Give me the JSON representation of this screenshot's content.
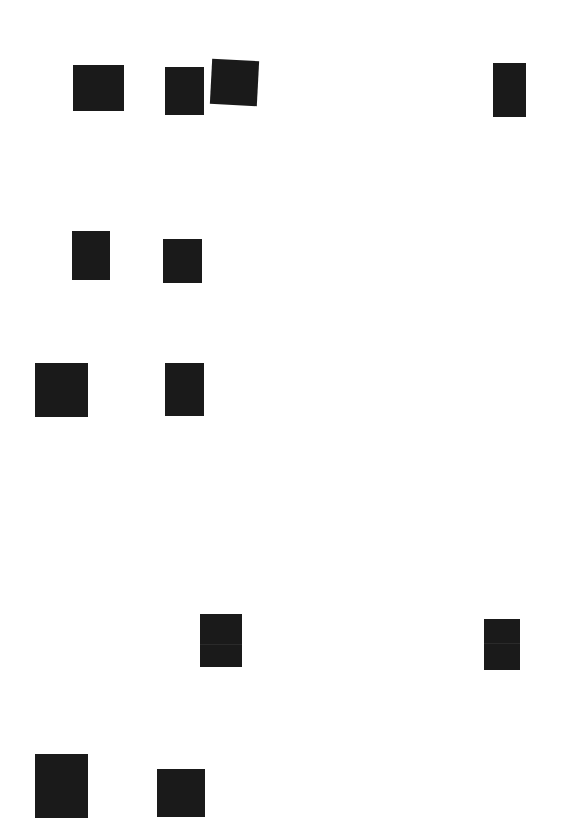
{
  "document": {
    "type": "redacted scanned page",
    "background_color": "#ffffff",
    "redaction_color": "#1a1a1a",
    "visible_text": []
  },
  "redactions": [
    {
      "id": 1,
      "x": 73,
      "y": 65,
      "w": 51,
      "h": 46,
      "rotate": 0
    },
    {
      "id": 2,
      "x": 165,
      "y": 67,
      "w": 39,
      "h": 48,
      "rotate": 0
    },
    {
      "id": 3,
      "x": 211,
      "y": 60,
      "w": 47,
      "h": 45,
      "rotate": 3
    },
    {
      "id": 4,
      "x": 493,
      "y": 63,
      "w": 33,
      "h": 54,
      "rotate": 0
    },
    {
      "id": 5,
      "x": 72,
      "y": 231,
      "w": 38,
      "h": 49,
      "rotate": 0
    },
    {
      "id": 6,
      "x": 163,
      "y": 239,
      "w": 39,
      "h": 44,
      "rotate": 0
    },
    {
      "id": 7,
      "x": 35,
      "y": 363,
      "w": 53,
      "h": 54,
      "rotate": 0
    },
    {
      "id": 8,
      "x": 165,
      "y": 363,
      "w": 39,
      "h": 53,
      "rotate": 0
    },
    {
      "id": 9,
      "x": 200,
      "y": 614,
      "w": 42,
      "h": 53,
      "rotate": 0,
      "seam_at": 30
    },
    {
      "id": 10,
      "x": 484,
      "y": 619,
      "w": 36,
      "h": 51,
      "rotate": 0,
      "seam_at": 24
    },
    {
      "id": 11,
      "x": 35,
      "y": 754,
      "w": 53,
      "h": 64,
      "rotate": 0
    },
    {
      "id": 12,
      "x": 157,
      "y": 769,
      "w": 48,
      "h": 48,
      "rotate": 0
    }
  ]
}
